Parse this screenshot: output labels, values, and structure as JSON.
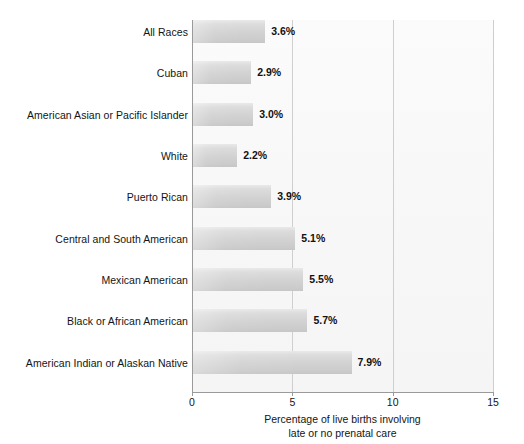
{
  "chart_data": {
    "type": "bar",
    "orientation": "horizontal",
    "title": "",
    "xlabel_line1": "Percentage of live births involving",
    "xlabel_line2": "late or no prenatal care",
    "ylabel": "",
    "xlim": [
      0,
      15
    ],
    "xticks": [
      "0",
      "5",
      "10",
      "15"
    ],
    "xtick_values": [
      0,
      5,
      10,
      15
    ],
    "grid": true,
    "grid_axis": "x",
    "legend": false,
    "value_suffix": "%",
    "categories": [
      "All Races",
      "Cuban",
      "American Asian or Pacific Islander",
      "White",
      "Puerto Rican",
      "Central and South American",
      "Mexican American",
      "Black or African American",
      "American Indian or Alaskan Native"
    ],
    "values": [
      3.6,
      2.9,
      3.0,
      2.2,
      3.9,
      5.1,
      5.5,
      5.7,
      7.9
    ],
    "value_labels": [
      "3.6%",
      "2.9%",
      "3.0%",
      "2.2%",
      "3.9%",
      "5.1%",
      "5.5%",
      "5.7%",
      "7.9%"
    ],
    "colors": {
      "bar_light": "#e9e9e9",
      "bar_dark": "#c6c6c6",
      "plot_background": "#f7f7f7",
      "gridline": "#cfcfcf",
      "axis": "#9a9a9a",
      "text": "#141414"
    }
  }
}
